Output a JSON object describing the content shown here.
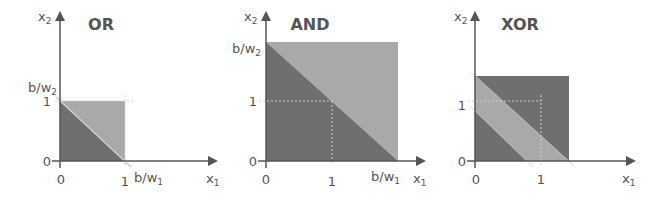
{
  "colors": {
    "dark_region": "#6f6f6f",
    "light_region": "#a9a9a9",
    "axis": "#555555",
    "guide": "#cfcfcf",
    "text": "#555555"
  },
  "panels": [
    {
      "title": "OR",
      "x_axis_label": "x",
      "x_axis_sub": "1",
      "y_axis_label": "x",
      "y_axis_sub": "2",
      "x_ticks": [
        "0",
        "1"
      ],
      "y_ticks": [
        "0",
        "1"
      ],
      "x_intercept_label": "b/w",
      "x_intercept_sub": "1",
      "y_intercept_label": "b/w",
      "y_intercept_sub": "2"
    },
    {
      "title": "AND",
      "x_axis_label": "x",
      "x_axis_sub": "1",
      "y_axis_label": "x",
      "y_axis_sub": "2",
      "x_ticks": [
        "0",
        "1"
      ],
      "y_ticks": [
        "0",
        "1"
      ],
      "x_intercept_label": "b/w",
      "x_intercept_sub": "1",
      "y_intercept_label": "b/w",
      "y_intercept_sub": "2"
    },
    {
      "title": "XOR",
      "x_axis_label": "x",
      "x_axis_sub": "1",
      "y_axis_label": "x",
      "y_axis_sub": "2",
      "x_ticks": [
        "0",
        "1"
      ],
      "y_ticks": [
        "0",
        "1"
      ]
    }
  ]
}
